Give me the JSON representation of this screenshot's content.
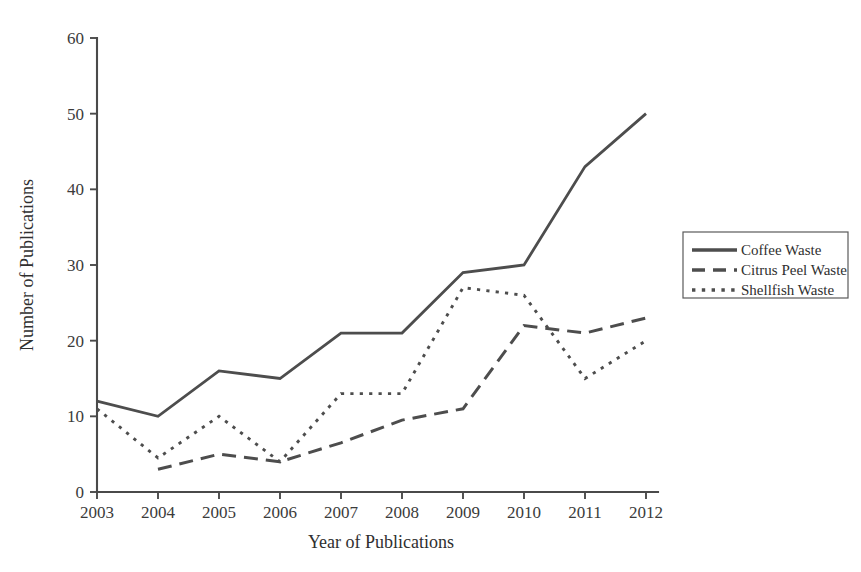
{
  "chart_data": {
    "type": "line",
    "title": "",
    "xlabel": "Year of Publications",
    "ylabel": "Number of Publications",
    "categories": [
      2003,
      2004,
      2005,
      2006,
      2007,
      2008,
      2009,
      2010,
      2011,
      2012
    ],
    "x_tick_labels": [
      "2003",
      "2004",
      "2005",
      "2006",
      "2007",
      "2008",
      "2009",
      "2010",
      "2011",
      "2012"
    ],
    "y_tick_labels": [
      "0",
      "10",
      "20",
      "30",
      "40",
      "50",
      "60"
    ],
    "y_ticks": [
      0,
      10,
      20,
      30,
      40,
      50,
      60
    ],
    "ylim": [
      0,
      60
    ],
    "grid": false,
    "legend_position": "right",
    "series": [
      {
        "name": "Coffee Waste",
        "style": "solid",
        "color": "#4d4d4d",
        "x": [
          2003,
          2004,
          2005,
          2006,
          2007,
          2008,
          2009,
          2010,
          2011,
          2012
        ],
        "values": [
          12,
          10,
          16,
          15,
          21,
          21,
          29,
          30,
          43,
          50
        ]
      },
      {
        "name": "Citrus Peel Waste",
        "style": "dashed",
        "color": "#4d4d4d",
        "x": [
          2004,
          2005,
          2006,
          2007,
          2008,
          2009,
          2010,
          2011,
          2012
        ],
        "values": [
          3,
          5,
          4,
          6.5,
          9.5,
          11,
          22,
          21,
          23
        ]
      },
      {
        "name": "Shellfish Waste",
        "style": "dotted",
        "color": "#4d4d4d",
        "x": [
          2003,
          2004,
          2005,
          2006,
          2007,
          2008,
          2009,
          2010,
          2011,
          2012
        ],
        "values": [
          11,
          4.5,
          10,
          4,
          13,
          13,
          27,
          26,
          15,
          20
        ]
      }
    ]
  },
  "axes": {
    "x_title": "Year of Publications",
    "y_title": "Number of Publications"
  },
  "legend": {
    "items": [
      {
        "label": "Coffee Waste",
        "style": "solid"
      },
      {
        "label": "Citrus Peel Waste",
        "style": "dashed"
      },
      {
        "label": "Shellfish Waste",
        "style": "dotted"
      }
    ]
  }
}
